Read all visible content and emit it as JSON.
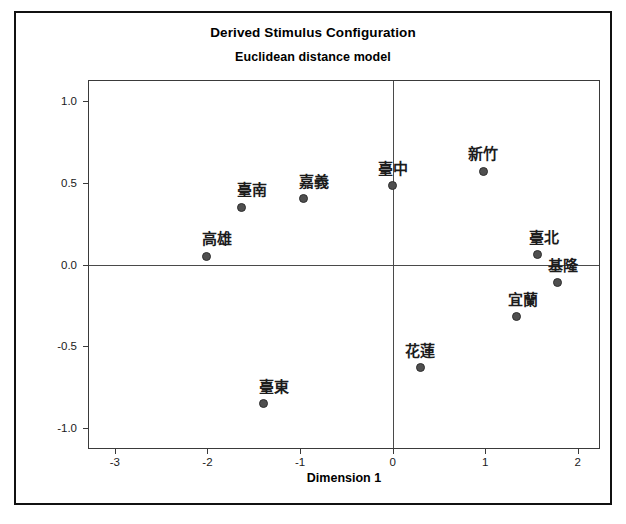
{
  "figure": {
    "title": "Derived Stimulus Configuration",
    "subtitle": "Euclidean distance model"
  },
  "chart_data": {
    "type": "scatter",
    "title": "Derived Stimulus Configuration",
    "subtitle": "Euclidean distance model",
    "xlabel": "Dimension 1",
    "ylabel": "Dimension 2",
    "xlim": [
      -3.28,
      2.23
    ],
    "ylim": [
      -1.12,
      1.12
    ],
    "xticks": [
      -3,
      -2,
      -1,
      0,
      1,
      2
    ],
    "xtick_labels": [
      "-3",
      "-2",
      "-1",
      "0",
      "1",
      "2"
    ],
    "yticks": [
      1.0,
      0.5,
      0.0,
      -0.5,
      -1.0
    ],
    "ytick_labels": [
      "1.0",
      "0.5",
      "0.0",
      "-0.5",
      "-1.0"
    ],
    "grid": false,
    "legend": false,
    "reference_lines": {
      "x": 0,
      "y": 0
    },
    "marker_color": "#4f4f4f",
    "points": [
      {
        "label": "臺中",
        "x": 0.0,
        "y": 0.48,
        "label_dx": 0,
        "label_dy": -8
      },
      {
        "label": "新竹",
        "x": 0.98,
        "y": 0.57,
        "label_dx": 0,
        "label_dy": -8
      },
      {
        "label": "臺南",
        "x": -1.63,
        "y": 0.35,
        "label_dx": 10,
        "label_dy": -8
      },
      {
        "label": "嘉義",
        "x": -0.96,
        "y": 0.4,
        "label_dx": 10,
        "label_dy": -8
      },
      {
        "label": "高雄",
        "x": -2.01,
        "y": 0.05,
        "label_dx": 10,
        "label_dy": -8
      },
      {
        "label": "臺北",
        "x": 1.57,
        "y": 0.06,
        "label_dx": 6,
        "label_dy": -8
      },
      {
        "label": "基隆",
        "x": 1.78,
        "y": -0.11,
        "label_dx": 6,
        "label_dy": -8
      },
      {
        "label": "宜蘭",
        "x": 1.34,
        "y": -0.32,
        "label_dx": 6,
        "label_dy": -8
      },
      {
        "label": "花蓮",
        "x": 0.3,
        "y": -0.63,
        "label_dx": 0,
        "label_dy": -8
      },
      {
        "label": "臺東",
        "x": -1.39,
        "y": -0.85,
        "label_dx": 10,
        "label_dy": -8
      }
    ]
  }
}
